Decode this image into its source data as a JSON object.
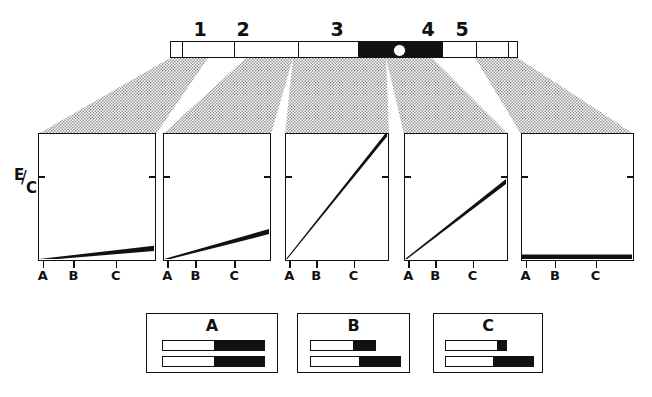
{
  "figure": {
    "type": "scientific-diagram"
  },
  "chromosome": {
    "name": "chromosome-ideogram",
    "region_labels": [
      "1",
      "2",
      "3",
      "4",
      "5"
    ],
    "region_label_x": [
      200,
      243,
      337,
      428,
      462
    ],
    "segments": [
      {
        "id": "seg-tip-left",
        "x": 0,
        "width": 12,
        "fill": "white"
      },
      {
        "id": "seg-1",
        "x": 12,
        "width": 52,
        "fill": "white"
      },
      {
        "id": "seg-2",
        "x": 64,
        "width": 64,
        "fill": "white"
      },
      {
        "id": "seg-3",
        "x": 128,
        "width": 60,
        "fill": "white"
      },
      {
        "id": "seg-band-p",
        "x": 188,
        "width": 42,
        "fill": "black"
      },
      {
        "id": "seg-band-q",
        "x": 230,
        "width": 42,
        "fill": "black"
      },
      {
        "id": "seg-4",
        "x": 272,
        "width": 34,
        "fill": "white"
      },
      {
        "id": "seg-5",
        "x": 306,
        "width": 32,
        "fill": "white"
      },
      {
        "id": "seg-tip-right",
        "x": 338,
        "width": 10,
        "fill": "white"
      }
    ],
    "centromere": {
      "name": "centromere",
      "x": 222,
      "fill": "white"
    }
  },
  "axis": {
    "y_label_numerator": "E",
    "y_label_slash": "/",
    "y_label_denominator": "C",
    "x_tick_labels": [
      "A",
      "B",
      "C"
    ]
  },
  "chart_data": {
    "type": "line",
    "title": "",
    "xlabel": "",
    "ylabel": "E/C",
    "x": [
      "A",
      "B",
      "C"
    ],
    "xlim": [
      0,
      1
    ],
    "ylim": [
      0,
      1
    ],
    "grid": false,
    "legend_position": "none",
    "panels": [
      {
        "name": "panel-region-1",
        "region": "1",
        "values": [
          0.0,
          0.03,
          0.075
        ],
        "slope": "very shallow",
        "line_start_frac": [
          0.0,
          0.0
        ],
        "line_end_frac": [
          1.0,
          0.085
        ]
      },
      {
        "name": "panel-region-2",
        "region": "2",
        "values": [
          0.0,
          0.09,
          0.2
        ],
        "slope": "shallow",
        "line_start_frac": [
          0.0,
          0.0
        ],
        "line_end_frac": [
          1.0,
          0.22
        ]
      },
      {
        "name": "panel-region-3",
        "region": "3",
        "values": [
          0.0,
          0.5,
          1.0
        ],
        "slope": "full diagonal",
        "line_start_frac": [
          0.0,
          0.0
        ],
        "line_end_frac": [
          1.0,
          1.0
        ]
      },
      {
        "name": "panel-region-4",
        "region": "4",
        "values": [
          0.0,
          0.3,
          0.6
        ],
        "slope": "moderate",
        "line_start_frac": [
          0.0,
          0.0
        ],
        "line_end_frac": [
          1.0,
          0.62
        ]
      },
      {
        "name": "panel-region-5",
        "region": "5",
        "values": [
          0.0,
          0.0,
          0.0
        ],
        "slope": "flat",
        "line_start_frac": [
          0.0,
          0.0
        ],
        "line_end_frac": [
          1.0,
          0.0
        ]
      }
    ]
  },
  "panels_layout": [
    {
      "x": 38,
      "width": 118
    },
    {
      "x": 163,
      "width": 108
    },
    {
      "x": 285,
      "width": 104
    },
    {
      "x": 404,
      "width": 104
    },
    {
      "x": 521,
      "width": 113
    }
  ],
  "legend": {
    "boxes": [
      {
        "name": "legend-box-a",
        "label": "A",
        "x": 146,
        "width": 132,
        "bars": [
          {
            "name": "legend-bar-a-top",
            "x": 15,
            "y": 26,
            "width": 103,
            "black_fraction": 0.5
          },
          {
            "name": "legend-bar-a-bottom",
            "x": 15,
            "y": 42,
            "width": 103,
            "black_fraction": 0.5
          }
        ]
      },
      {
        "name": "legend-box-b",
        "label": "B",
        "x": 297,
        "width": 113,
        "bars": [
          {
            "name": "legend-bar-b-top",
            "x": 12,
            "y": 26,
            "width": 66,
            "black_fraction": 0.35
          },
          {
            "name": "legend-bar-b-bottom",
            "x": 12,
            "y": 42,
            "width": 91,
            "black_fraction": 0.46
          }
        ]
      },
      {
        "name": "legend-box-c",
        "label": "C",
        "x": 433,
        "width": 110,
        "bars": [
          {
            "name": "legend-bar-c-top",
            "x": 11,
            "y": 26,
            "width": 62,
            "black_fraction": 0.15
          },
          {
            "name": "legend-bar-c-bottom",
            "x": 11,
            "y": 42,
            "width": 89,
            "black_fraction": 0.46
          }
        ]
      }
    ]
  },
  "fan": {
    "name": "projection-fan",
    "style": "stippled halftone",
    "stipple_color": "#8d8d8d",
    "chromosome_anchors": [
      170,
      208,
      246,
      293,
      340,
      386,
      432,
      475,
      518
    ],
    "panel_anchors": [
      38,
      156,
      163,
      271,
      285,
      389,
      404,
      508,
      521,
      634
    ]
  },
  "colors": {
    "ink": "#111111",
    "paper": "#ffffff",
    "stipple": "#8d8d8d"
  }
}
